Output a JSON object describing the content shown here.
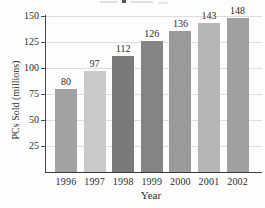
{
  "chart_data": {
    "type": "bar",
    "categories": [
      "1996",
      "1997",
      "1998",
      "1999",
      "2000",
      "2001",
      "2002"
    ],
    "values": [
      80,
      97,
      112,
      126,
      136,
      143,
      148
    ],
    "value_labels": [
      "80",
      "97",
      "112",
      "126",
      "136",
      "143",
      "148"
    ],
    "xlabel": "Year",
    "ylabel": "PCs Sold (millions)",
    "yticks": [
      25,
      50,
      75,
      100,
      125,
      150
    ],
    "ytick_labels": [
      "25",
      "50",
      "75",
      "100",
      "125",
      "150"
    ],
    "ylim": [
      0,
      150
    ],
    "grid": true,
    "legend": "none",
    "title": "",
    "bar_colors": [
      "#a2a2a2",
      "#c9c9c9",
      "#7a7a7a",
      "#848484",
      "#9b9b9b",
      "#b5b5b5",
      "#a0a0a0"
    ]
  },
  "colors": {
    "background": "#fdfdfd",
    "gridline": "#e8d9d9",
    "axis": "#4a4a4a",
    "text": "#2b2b2b"
  }
}
